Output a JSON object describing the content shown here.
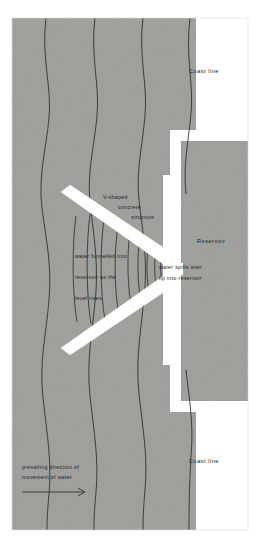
{
  "diagram": {
    "background_color": "#ffffff",
    "sea_color": "#9e9e9b",
    "land_color": "#ffffff",
    "structure_color": "#ffffff",
    "line_color": "#2a2a28",
    "text_color": "#20201e"
  },
  "labels": {
    "coast_line_top": "Coast line",
    "coast_line_bottom": "Coast line",
    "reservoir": "Reservoir",
    "structure_line1": "V-shaped",
    "structure_line2": "concrete",
    "structure_line3": "structure",
    "funnel_line1": "water funnelled into",
    "funnel_line2": "reservoir as the",
    "funnel_line3": "level rises",
    "spill_line1": "water spills over",
    "spill_line2": "lip into reservoir",
    "flow_line1": "prevailing direction of",
    "flow_line2": "movement of water"
  },
  "elements": {
    "wave_lines_count": 4,
    "funnel_lines_count": 9,
    "arrow": "flow-direction-arrow",
    "structure_arms": 2
  }
}
